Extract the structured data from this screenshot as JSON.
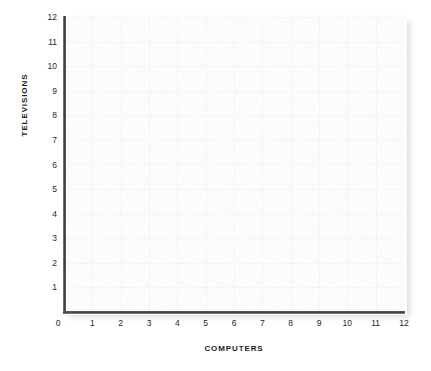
{
  "chart_data": {
    "type": "scatter",
    "title": "",
    "subtitle": "",
    "xlabel": "COMPUTERS",
    "ylabel": "TELEVISIONS",
    "xlim": [
      0,
      12
    ],
    "ylim": [
      0,
      12
    ],
    "x_ticks": [
      "0",
      "1",
      "2",
      "3",
      "4",
      "5",
      "6",
      "7",
      "8",
      "9",
      "10",
      "11",
      "12"
    ],
    "y_ticks": [
      "1",
      "2",
      "3",
      "4",
      "5",
      "6",
      "7",
      "8",
      "9",
      "10",
      "11",
      "12"
    ],
    "origin_label": "0",
    "grid": true,
    "legend": null,
    "annotations": [],
    "series": [
      {
        "name": "",
        "x": [],
        "y": []
      }
    ],
    "note": "Empty plotting grid - no data points are drawn in the plot area."
  },
  "colors": {
    "axis": "#3f3f3f",
    "grid": "#f2f2f2",
    "plot_background": "#fdfdfd",
    "page_background": "#ffffff",
    "label_text": "#1d1d1d"
  }
}
